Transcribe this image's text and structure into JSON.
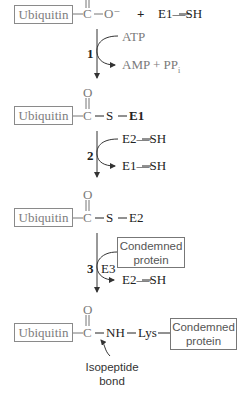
{
  "diagram": {
    "rows": [
      {
        "id": "row1",
        "box_label": "Ubiquitin",
        "carbonyl_carbon": "C",
        "carbonyl_oxygen": "O",
        "bond_tail": "O⁻",
        "plus": "+",
        "partner": "E1—SH"
      },
      {
        "id": "row2",
        "box_label": "Ubiquitin",
        "carbonyl_carbon": "C",
        "carbonyl_oxygen": "O",
        "sulfur": "S",
        "enzyme": "E1"
      },
      {
        "id": "row3",
        "box_label": "Ubiquitin",
        "carbonyl_carbon": "C",
        "carbonyl_oxygen": "O",
        "sulfur": "S",
        "enzyme": "E2"
      },
      {
        "id": "row4",
        "box_label": "Ubiquitin",
        "carbonyl_carbon": "C",
        "carbonyl_oxygen": "O",
        "amine": "NH",
        "residue": "Lys",
        "protein_box_line1": "Condemned",
        "protein_box_line2": "protein"
      }
    ],
    "steps": [
      {
        "number": "1",
        "input": "ATP",
        "output": "AMP + PP",
        "output_subscript": "i"
      },
      {
        "number": "2",
        "input": "E2—SH",
        "output": "E1—SH"
      },
      {
        "number": "3",
        "enzyme": "E3",
        "input_box_line1": "Condemned",
        "input_box_line2": "protein",
        "output": "E2—SH"
      }
    ],
    "annotation": {
      "line1": "Isopeptide",
      "line2": "bond"
    },
    "colors": {
      "box_border": "#8a8a8a",
      "box_text": "#7d7d7d",
      "text": "#222222",
      "arrow": "#333333"
    }
  }
}
